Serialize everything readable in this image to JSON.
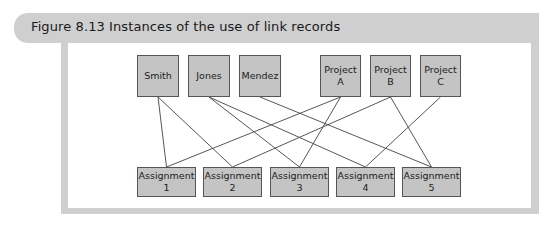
{
  "figure": {
    "title": "Figure 8.13  Instances of the use of link records"
  },
  "colors": {
    "frame": "#cfcfcf",
    "box_fill": "#c4c4c4",
    "box_border": "#555555",
    "line": "#444444"
  },
  "top_nodes": [
    {
      "id": "smith",
      "label": "Smith",
      "x": 137,
      "y": 55,
      "w": 42,
      "h": 42
    },
    {
      "id": "jones",
      "label": "Jones",
      "x": 188,
      "y": 55,
      "w": 42,
      "h": 42
    },
    {
      "id": "mendez",
      "label": "Mendez",
      "x": 239,
      "y": 55,
      "w": 42,
      "h": 42
    },
    {
      "id": "projA",
      "label": "Project\nA",
      "x": 320,
      "y": 55,
      "w": 41,
      "h": 42
    },
    {
      "id": "projB",
      "label": "Project\nB",
      "x": 370,
      "y": 55,
      "w": 41,
      "h": 42
    },
    {
      "id": "projC",
      "label": "Project\nC",
      "x": 420,
      "y": 55,
      "w": 41,
      "h": 42
    }
  ],
  "bottom_nodes": [
    {
      "id": "a1",
      "label": "Assignment\n1",
      "x": 137,
      "y": 167,
      "w": 59,
      "h": 30
    },
    {
      "id": "a2",
      "label": "Assignment\n2",
      "x": 203,
      "y": 167,
      "w": 59,
      "h": 30
    },
    {
      "id": "a3",
      "label": "Assignment\n3",
      "x": 270,
      "y": 167,
      "w": 59,
      "h": 30
    },
    {
      "id": "a4",
      "label": "Assignment\n4",
      "x": 336,
      "y": 167,
      "w": 59,
      "h": 30
    },
    {
      "id": "a5",
      "label": "Assignment\n5",
      "x": 402,
      "y": 167,
      "w": 59,
      "h": 30
    }
  ],
  "links": [
    {
      "from": "smith",
      "to": "a1"
    },
    {
      "from": "smith",
      "to": "a2"
    },
    {
      "from": "jones",
      "to": "a3"
    },
    {
      "from": "jones",
      "to": "a4"
    },
    {
      "from": "mendez",
      "to": "a5"
    },
    {
      "from": "projA",
      "to": "a1"
    },
    {
      "from": "projA",
      "to": "a3"
    },
    {
      "from": "projB",
      "to": "a2"
    },
    {
      "from": "projB",
      "to": "a5"
    },
    {
      "from": "projC",
      "to": "a4"
    }
  ]
}
